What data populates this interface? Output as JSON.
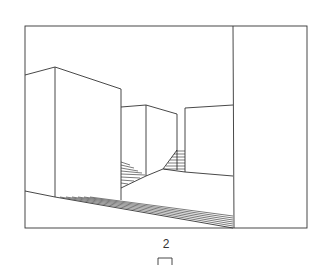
{
  "figure": {
    "type": "perspective line drawing",
    "label": "2"
  },
  "colors": {
    "line": "#333333",
    "background": "#ffffff"
  }
}
